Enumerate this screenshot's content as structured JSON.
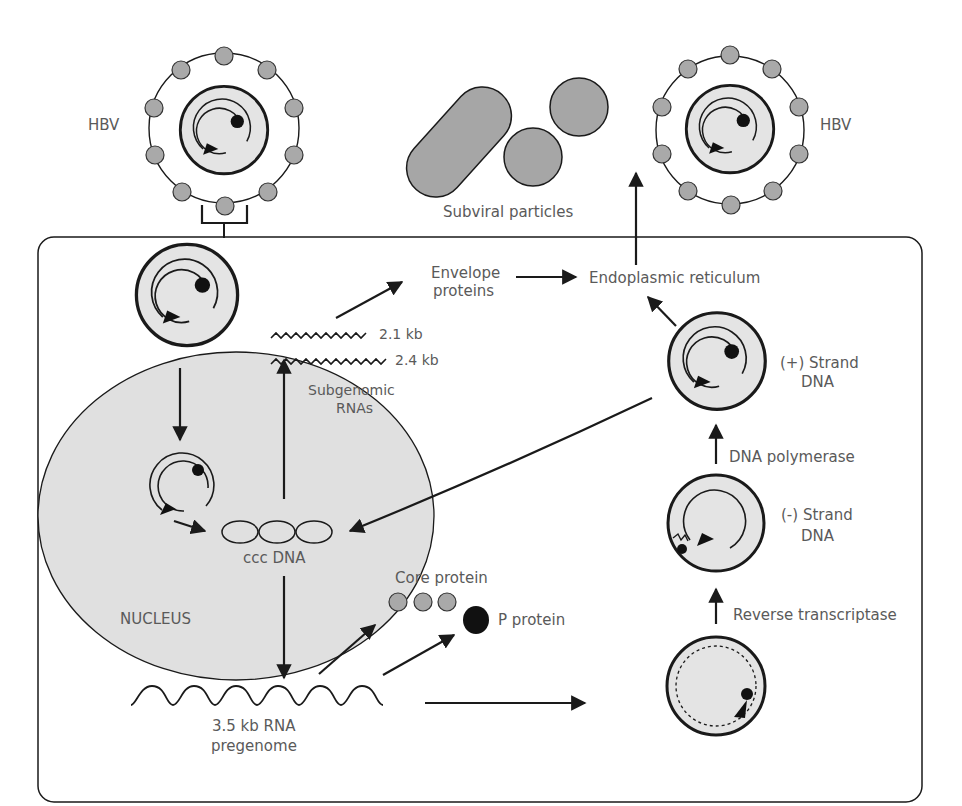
{
  "colors": {
    "line": "#1a1a1a",
    "text": "#5a5a5a",
    "capsid_fill": "#e4e4e4",
    "nucleus_fill": "#e0e0e0",
    "protein_fill": "#a9a9a9",
    "particle_fill": "#a6a6a6",
    "p_protein_fill": "#111111"
  },
  "labels": {
    "hbv_left": "HBV",
    "hbv_right": "HBV",
    "subviral_particles": "Subviral particles",
    "envelope_proteins_1": "Envelope",
    "envelope_proteins_2": "proteins",
    "endoplasmic_reticulum": "Endoplasmic reticulum",
    "rna_21": "2.1 kb",
    "rna_24": "2.4 kb",
    "subgenomic_1": "Subgenomic",
    "subgenomic_2": "RNAs",
    "plus_strand_1": "(+) Strand",
    "plus_strand_2": "DNA",
    "dna_polymerase": "DNA polymerase",
    "minus_strand_1": "(-) Strand",
    "minus_strand_2": "DNA",
    "ccc_dna": "ccc DNA",
    "nucleus": "NUCLEUS",
    "core_protein": "Core protein",
    "p_protein": "P protein",
    "reverse_transcriptase": "Reverse transcriptase",
    "pregenome_1": "3.5 kb RNA",
    "pregenome_2": "pregenome"
  }
}
